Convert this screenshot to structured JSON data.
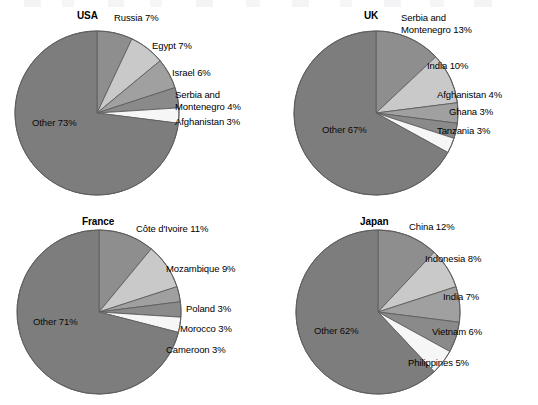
{
  "figure": {
    "background": "#ffffff",
    "width": 538,
    "height": 405
  },
  "palette": {
    "other": "#7d7d7d",
    "slice_1": "#8e8e8e",
    "slice_2": "#c9c9c9",
    "slice_3": "#a0a0a0",
    "slice_4": "#8a8a8a",
    "slice_5": "#f6f6f6",
    "outline": "#5f5f5f",
    "text": "#000000"
  },
  "chart_data": [
    {
      "type": "pie",
      "title": "USA",
      "xlabel": "",
      "ylabel": "",
      "start_angle_deg": 0,
      "direction": "clockwise",
      "categories": [
        "Russia",
        "Egypt",
        "Israel",
        "Serbia and Montenegro",
        "Afghanistan",
        "Other"
      ],
      "values": [
        7,
        7,
        6,
        4,
        3,
        73
      ],
      "labels": [
        "Russia 7%",
        "Egypt 7%",
        "Israel 6%",
        "Serbia and\nMontenegro 4%",
        "Afghanistan 3%",
        "Other 73%"
      ],
      "colors": [
        "#8e8e8e",
        "#c9c9c9",
        "#a0a0a0",
        "#8a8a8a",
        "#f6f6f6",
        "#7d7d7d"
      ]
    },
    {
      "type": "pie",
      "title": "UK",
      "xlabel": "",
      "ylabel": "",
      "start_angle_deg": 0,
      "direction": "clockwise",
      "categories": [
        "Serbia and Montenegro",
        "India",
        "Afghanistan",
        "Ghana",
        "Tanzania",
        "Other"
      ],
      "values": [
        13,
        10,
        4,
        3,
        3,
        67
      ],
      "labels": [
        "Serbia and\nMontenegro 13%",
        "India 10%",
        "Afghanistan 4%",
        "Ghana 3%",
        "Tanzania 3%",
        "Other 67%"
      ],
      "colors": [
        "#8e8e8e",
        "#c9c9c9",
        "#a0a0a0",
        "#8a8a8a",
        "#f6f6f6",
        "#7d7d7d"
      ]
    },
    {
      "type": "pie",
      "title": "France",
      "xlabel": "",
      "ylabel": "",
      "start_angle_deg": 0,
      "direction": "clockwise",
      "categories": [
        "Côte d'Ivoire",
        "Mozambique",
        "Poland",
        "Morocco",
        "Cameroon",
        "Other"
      ],
      "values": [
        11,
        9,
        3,
        3,
        3,
        71
      ],
      "labels": [
        "Côte d'Ivoire 11%",
        "Mozambique 9%",
        "Poland 3%",
        "Morocco 3%",
        "Cameroon 3%",
        "Other 71%"
      ],
      "colors": [
        "#8e8e8e",
        "#c9c9c9",
        "#a0a0a0",
        "#8a8a8a",
        "#f6f6f6",
        "#7d7d7d"
      ]
    },
    {
      "type": "pie",
      "title": "Japan",
      "xlabel": "",
      "ylabel": "",
      "start_angle_deg": 0,
      "direction": "clockwise",
      "categories": [
        "China",
        "Indonesia",
        "India",
        "Vietnam",
        "Philippines",
        "Other"
      ],
      "values": [
        12,
        8,
        7,
        6,
        5,
        62
      ],
      "labels": [
        "China 12%",
        "Indonesia 8%",
        "India 7%",
        "Vietnam 6%",
        "Philippines 5%",
        "Other 62%"
      ],
      "colors": [
        "#8e8e8e",
        "#c9c9c9",
        "#a0a0a0",
        "#8a8a8a",
        "#f6f6f6",
        "#7d7d7d"
      ]
    }
  ],
  "panels": [
    {
      "key": "usa",
      "title_pos": {
        "x": 77,
        "y": 10
      },
      "pie": {
        "cx": 97,
        "cy": 113,
        "r": 82
      },
      "labels": [
        {
          "text": "Russia 7%",
          "x": 114,
          "y": 12,
          "align": "left"
        },
        {
          "text": "Egypt 7%",
          "x": 152,
          "y": 40,
          "align": "left"
        },
        {
          "text": "Israel 6%",
          "x": 172,
          "y": 67,
          "align": "left"
        },
        {
          "text": "Serbia and\nMontenegro 4%",
          "x": 175,
          "y": 89,
          "align": "left"
        },
        {
          "text": "Afghanistan 3%",
          "x": 175,
          "y": 116,
          "align": "left"
        },
        {
          "text": "Other 73%",
          "x": 32,
          "y": 117,
          "align": "left",
          "on_slice": true
        }
      ]
    },
    {
      "key": "uk",
      "title_pos": {
        "x": 364,
        "y": 10
      },
      "pie": {
        "cx": 376,
        "cy": 113,
        "r": 82
      },
      "labels": [
        {
          "text": "Serbia and\nMontenegro 13%",
          "x": 401,
          "y": 12,
          "align": "left"
        },
        {
          "text": "India 10%",
          "x": 427,
          "y": 60,
          "align": "left"
        },
        {
          "text": "Afghanistan 4%",
          "x": 437,
          "y": 89,
          "align": "left"
        },
        {
          "text": "Ghana 3%",
          "x": 449,
          "y": 106,
          "align": "left"
        },
        {
          "text": "Tanzania 3%",
          "x": 437,
          "y": 125,
          "align": "left"
        },
        {
          "text": "Other 67%",
          "x": 322,
          "y": 124,
          "align": "left",
          "on_slice": true
        }
      ]
    },
    {
      "key": "france",
      "title_pos": {
        "x": 82,
        "y": 216
      },
      "pie": {
        "cx": 99,
        "cy": 312,
        "r": 82
      },
      "labels": [
        {
          "text": "Côte d'Ivoire 11%",
          "x": 136,
          "y": 223,
          "align": "left"
        },
        {
          "text": "Mozambique 9%",
          "x": 166,
          "y": 263,
          "align": "left"
        },
        {
          "text": "Poland 3%",
          "x": 186,
          "y": 303,
          "align": "left"
        },
        {
          "text": "Morocco 3%",
          "x": 180,
          "y": 323,
          "align": "left"
        },
        {
          "text": "Cameroon 3%",
          "x": 166,
          "y": 344,
          "align": "left"
        },
        {
          "text": "Other 71%",
          "x": 33,
          "y": 316,
          "align": "left",
          "on_slice": true
        }
      ]
    },
    {
      "key": "japan",
      "title_pos": {
        "x": 360,
        "y": 216
      },
      "pie": {
        "cx": 378,
        "cy": 312,
        "r": 82
      },
      "labels": [
        {
          "text": "China 12%",
          "x": 409,
          "y": 221,
          "align": "left"
        },
        {
          "text": "Indonesia 8%",
          "x": 425,
          "y": 253,
          "align": "left"
        },
        {
          "text": "India 7%",
          "x": 443,
          "y": 291,
          "align": "left"
        },
        {
          "text": "Vietnam 6%",
          "x": 432,
          "y": 326,
          "align": "left"
        },
        {
          "text": "Philippines 5%",
          "x": 408,
          "y": 357,
          "align": "left"
        },
        {
          "text": "Other 62%",
          "x": 314,
          "y": 325,
          "align": "left",
          "on_slice": true
        }
      ]
    }
  ]
}
